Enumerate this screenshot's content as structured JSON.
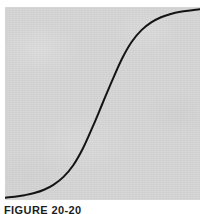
{
  "figure": {
    "caption": "FIGURE 20-20",
    "panel_color": "#d4d4d4",
    "page_background": "#ffffff",
    "curve_color": "#141414"
  },
  "chart_data": {
    "type": "line",
    "title": "",
    "subtitle": "",
    "xlabel": "",
    "ylabel": "",
    "grid": false,
    "legend": false,
    "legend_position": "none",
    "axis_visible": false,
    "tick_labels_x": [],
    "tick_labels_y": [],
    "xlim": [
      0,
      1
    ],
    "ylim": [
      0,
      1
    ],
    "annotations": [],
    "series": [
      {
        "name": "sigmoid",
        "color": "#141414",
        "line_width": 2,
        "x": [
          0.0,
          0.05,
          0.1,
          0.15,
          0.2,
          0.25,
          0.3,
          0.35,
          0.4,
          0.45,
          0.5,
          0.55,
          0.6,
          0.65,
          0.7,
          0.75,
          0.8,
          0.85,
          0.9,
          0.95,
          1.0
        ],
        "y": [
          0.012,
          0.017,
          0.025,
          0.036,
          0.053,
          0.08,
          0.12,
          0.18,
          0.268,
          0.38,
          0.5,
          0.62,
          0.732,
          0.82,
          0.88,
          0.92,
          0.947,
          0.964,
          0.975,
          0.982,
          0.988
        ]
      }
    ]
  }
}
